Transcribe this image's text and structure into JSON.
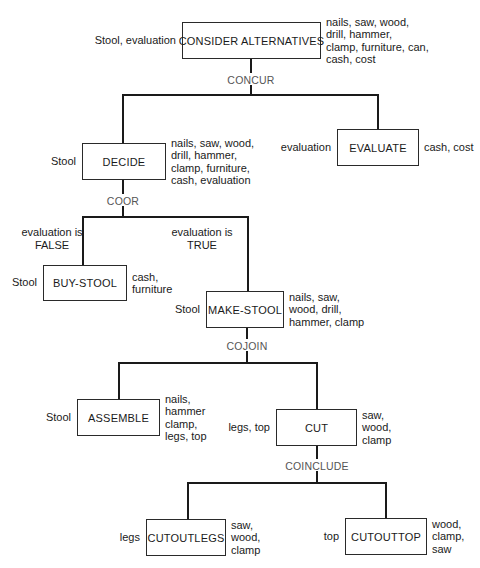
{
  "diagram": {
    "title": "",
    "line_color": "#1a1a1a",
    "nodes": [
      {
        "id": "consider-alternatives",
        "label": "CONSIDER ALTERNATIVES",
        "inputs": "Stool, evaluation",
        "outputs": "nails, saw, wood,\ndrill, hammer,\nclamp, furniture, can,\ncash, cost",
        "box": [
          182,
          22,
          139,
          37
        ]
      },
      {
        "id": "decide",
        "label": "DECIDE",
        "inputs": "Stool",
        "outputs": "nails, saw, wood,\ndrill, hammer,\nclamp, furniture,\ncash, evaluation",
        "box": [
          82,
          143,
          84,
          37
        ]
      },
      {
        "id": "evaluate",
        "label": "EVALUATE",
        "inputs": "evaluation",
        "outputs": "cash, cost",
        "box": [
          337,
          129,
          82,
          37
        ]
      },
      {
        "id": "buy-stool",
        "label": "BUY-STOOL",
        "inputs": "Stool",
        "outputs": "cash,\nfurniture",
        "box": [
          43,
          265,
          84,
          36
        ]
      },
      {
        "id": "make-stool",
        "label": "MAKE-STOOL",
        "inputs": "Stool",
        "outputs": "nails, saw,\nwood, drill,\nhammer, clamp",
        "box": [
          206,
          291,
          78,
          37
        ]
      },
      {
        "id": "assemble",
        "label": "ASSEMBLE",
        "inputs": "Stool",
        "outputs": "nails,\nhammer\nclamp,\nlegs, top",
        "box": [
          77,
          399,
          83,
          37
        ]
      },
      {
        "id": "cut",
        "label": "CUT",
        "inputs": "legs, top",
        "outputs": "saw,\nwood,\nclamp",
        "box": [
          276,
          409,
          81,
          37
        ]
      },
      {
        "id": "cut-out-legs",
        "label": "CUTOUTLEGS",
        "inputs": "legs",
        "outputs": "saw,\nwood,\nclamp",
        "box": [
          146,
          519,
          80,
          37
        ]
      },
      {
        "id": "cut-out-top",
        "label": "CUTOUTTOP",
        "inputs": "top",
        "outputs": "wood,\nclamp,\nsaw",
        "box": [
          345,
          518,
          82,
          37
        ]
      }
    ],
    "connectors": [
      {
        "id": "concur",
        "label": "CONCUR",
        "parent": "consider-alternatives",
        "children": [
          "decide",
          "evaluate"
        ],
        "stem_x": 251,
        "bar_y": 95,
        "label_y": 74
      },
      {
        "id": "coor",
        "label": "COOR",
        "parent": "decide",
        "children": [
          "buy-stool",
          "make-stool"
        ],
        "stem_x": 123,
        "bar_y": 217,
        "label_y": 195
      },
      {
        "id": "cojoin",
        "label": "COJOIN",
        "parent": "make-stool",
        "children": [
          "assemble",
          "cut"
        ],
        "stem_x": 247,
        "bar_y": 363,
        "label_y": 340
      },
      {
        "id": "coinclude",
        "label": "COINCLUDE",
        "parent": "cut",
        "children": [
          "cut-out-legs",
          "cut-out-top"
        ],
        "stem_x": 317,
        "bar_y": 483,
        "label_y": 460
      }
    ],
    "child_drop_x": {
      "decide": 123,
      "evaluate": 378,
      "buy-stool": 83,
      "make-stool": 248,
      "assemble": 119,
      "cut": 317,
      "cut-out-legs": 188,
      "cut-out-top": 386
    },
    "conditions": [
      {
        "id": "cond-false",
        "text": "evaluation is\nFALSE",
        "x": 52,
        "y": 226
      },
      {
        "id": "cond-true",
        "text": "evaluation is\nTRUE",
        "x": 202,
        "y": 226
      }
    ]
  }
}
